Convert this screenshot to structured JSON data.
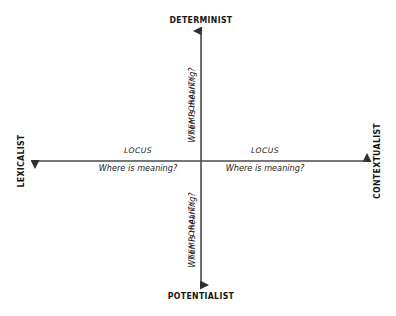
{
  "diagram": {
    "background_color": "#ffffff",
    "line_color": "#3f3f3f",
    "text_color": "#161616",
    "poles": {
      "top": "DETERMINIST",
      "bottom": "POTENTIALIST",
      "left": "LEXICALIST",
      "right": "CONTEXTUALIST"
    },
    "axes": {
      "vertical": {
        "name": "TEMPORALITY",
        "question": "When is meaning?",
        "orientation": "vertical",
        "arrowheads": "both"
      },
      "horizontal": {
        "name": "LOCUS",
        "question": "Where is meaning?",
        "orientation": "horizontal",
        "arrowheads": "both"
      }
    },
    "quadrant_labels": [
      {
        "id": "upper",
        "name": "TEMPORALITY",
        "question": "When is meaning?"
      },
      {
        "id": "lower",
        "name": "TEMPORALITY",
        "question": "When is meaning?"
      },
      {
        "id": "left",
        "name": "LOCUS",
        "question": "Where is meaning?"
      },
      {
        "id": "right",
        "name": "LOCUS",
        "question": "Where is meaning?"
      }
    ]
  }
}
